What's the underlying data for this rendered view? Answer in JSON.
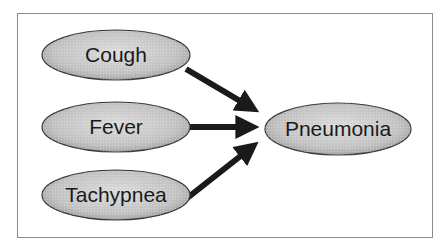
{
  "diagram": {
    "type": "causal-graph",
    "nodes": [
      {
        "id": "cough",
        "label": "Cough",
        "cx": 116,
        "cy": 55,
        "rx": 74,
        "ry": 25
      },
      {
        "id": "fever",
        "label": "Fever",
        "cx": 116,
        "cy": 127,
        "rx": 74,
        "ry": 25
      },
      {
        "id": "tachypnea",
        "label": "Tachypnea",
        "cx": 116,
        "cy": 195,
        "rx": 74,
        "ry": 25
      },
      {
        "id": "pneumonia",
        "label": "Pneumonia",
        "cx": 338,
        "cy": 129,
        "rx": 73,
        "ry": 26
      }
    ],
    "edges": [
      {
        "from": "cough",
        "to": "pneumonia"
      },
      {
        "from": "fever",
        "to": "pneumonia"
      },
      {
        "from": "tachypnea",
        "to": "pneumonia"
      }
    ],
    "colors": {
      "node_fill": "#c4c4c4",
      "node_stroke": "#3a3a3a",
      "arrow": "#1a1a1a",
      "frame": "#8a8a8a"
    }
  }
}
